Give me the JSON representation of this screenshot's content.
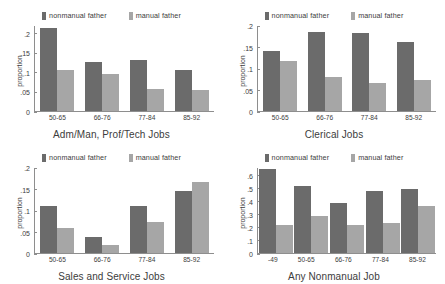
{
  "legend": {
    "nonmanual_label": "nonmanual father",
    "manual_label": "manual father",
    "nonmanual_color": "#6b6b6b",
    "manual_color": "#a6a6a6"
  },
  "axis": {
    "ylabel": "proportion"
  },
  "chart_data": [
    {
      "type": "bar",
      "title": "Adm/Man, Prof/Tech Jobs",
      "xlabel": "",
      "ylabel": "proportion",
      "categories": [
        "50-65",
        "66-76",
        "77-84",
        "85-92"
      ],
      "yticks": [
        "0",
        ".05",
        ".1",
        ".15",
        ".2"
      ],
      "ytick_values": [
        0,
        0.05,
        0.1,
        0.15,
        0.2
      ],
      "ylim": [
        0,
        0.22
      ],
      "grid": false,
      "legend_position": "top-center",
      "series": [
        {
          "name": "nonmanual father",
          "values": [
            0.215,
            0.128,
            0.133,
            0.105
          ]
        },
        {
          "name": "manual father",
          "values": [
            0.105,
            0.095,
            0.057,
            0.055
          ]
        }
      ]
    },
    {
      "type": "bar",
      "title": "Clerical Jobs",
      "xlabel": "",
      "ylabel": "proportion",
      "categories": [
        "50-65",
        "66-76",
        "77-84",
        "85-92"
      ],
      "yticks": [
        "0",
        ".05",
        ".1",
        ".15",
        ".2"
      ],
      "ytick_values": [
        0,
        0.05,
        0.1,
        0.15,
        0.2
      ],
      "ylim": [
        0,
        0.2
      ],
      "grid": false,
      "legend_position": "top-center",
      "series": [
        {
          "name": "nonmanual father",
          "values": [
            0.142,
            0.185,
            0.183,
            0.162
          ]
        },
        {
          "name": "manual father",
          "values": [
            0.118,
            0.08,
            0.065,
            0.074
          ]
        }
      ]
    },
    {
      "type": "bar",
      "title": "Sales and Service Jobs",
      "xlabel": "",
      "ylabel": "proportion",
      "categories": [
        "50-65",
        "66-76",
        "77-84",
        "85-92"
      ],
      "yticks": [
        "0",
        ".05",
        ".1",
        ".15",
        ".2"
      ],
      "ytick_values": [
        0,
        0.05,
        0.1,
        0.15,
        0.2
      ],
      "ylim": [
        0,
        0.2
      ],
      "grid": false,
      "legend_position": "top-center",
      "series": [
        {
          "name": "nonmanual father",
          "values": [
            0.11,
            0.038,
            0.11,
            0.146
          ]
        },
        {
          "name": "manual father",
          "values": [
            0.058,
            0.019,
            0.072,
            0.167
          ]
        }
      ]
    },
    {
      "type": "bar",
      "title": "Any Nonmanual Job",
      "xlabel": "",
      "ylabel": "proportion",
      "categories": [
        "-49",
        "50-65",
        "66-76",
        "77-84",
        "85-92"
      ],
      "yticks": [
        "0",
        ".1",
        ".2",
        ".3",
        ".4",
        ".5",
        ".6"
      ],
      "ytick_values": [
        0,
        0.1,
        0.2,
        0.3,
        0.4,
        0.5,
        0.6
      ],
      "ylim": [
        0,
        0.66
      ],
      "grid": false,
      "legend_position": "top-center",
      "series": [
        {
          "name": "nonmanual father",
          "values": [
            0.655,
            0.52,
            0.39,
            0.48,
            0.5
          ]
        },
        {
          "name": "manual father",
          "values": [
            0.22,
            0.29,
            0.215,
            0.235,
            0.365
          ]
        }
      ]
    }
  ]
}
